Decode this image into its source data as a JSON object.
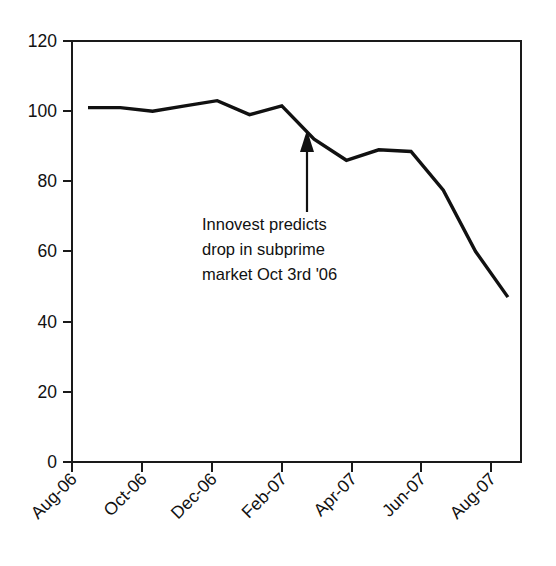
{
  "chart_data": {
    "type": "line",
    "title": "",
    "subtitle": "",
    "xlabel": "",
    "ylabel": "",
    "ylim": [
      0,
      120
    ],
    "yticks": [
      0,
      20,
      40,
      60,
      80,
      100,
      120
    ],
    "ytick_labels": [
      "0",
      "20",
      "40",
      "60",
      "80",
      "100",
      "120"
    ],
    "xtick_labels": [
      "Aug-06",
      "Oct-06",
      "Dec-06",
      "Feb-07",
      "Apr-07",
      "Jun-07",
      "Aug-07"
    ],
    "x": [
      "Aug-06",
      "Sep-06",
      "Oct-06",
      "Nov-06",
      "Dec-06",
      "Jan-07",
      "Feb-07",
      "Mar-07",
      "Apr-07",
      "May-07",
      "Jun-07",
      "Jul-07",
      "Aug-07",
      "Sep-07"
    ],
    "values": [
      101,
      101,
      100,
      101.5,
      103,
      99,
      101.5,
      92,
      86,
      89,
      88.5,
      77.5,
      60,
      47
    ],
    "series": [
      {
        "name": "Subprime index",
        "values": [
          101,
          101,
          100,
          101.5,
          103,
          99,
          101.5,
          92,
          86,
          89,
          88.5,
          77.5,
          60,
          47
        ]
      }
    ],
    "grid": false,
    "legend": "none",
    "line_color": "#111111",
    "annotations": [
      {
        "name": "innovest-prediction",
        "lines": [
          "Innovest predicts",
          "drop in subprime",
          "market Oct 3rd '06"
        ],
        "arrow_points_to_value": 93,
        "arrow_points_to_x": "Feb-07"
      }
    ]
  },
  "annotation": {
    "line1": "Innovest predicts",
    "line2": "drop in subprime",
    "line3": "market Oct 3rd '06"
  },
  "axis": {
    "y_labels": [
      "120",
      "100",
      "80",
      "60",
      "40",
      "20",
      "0"
    ],
    "x_labels": [
      "Aug-06",
      "Oct-06",
      "Dec-06",
      "Feb-07",
      "Apr-07",
      "Jun-07",
      "Aug-07"
    ]
  },
  "colors": {
    "line": "#111111",
    "axis": "#1a1a1a",
    "background": "#ffffff",
    "text": "#111111"
  }
}
